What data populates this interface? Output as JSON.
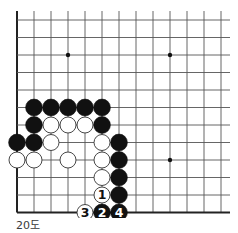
{
  "diagram": {
    "type": "go-board-fragment",
    "caption": "20도",
    "grid": {
      "columns": 13,
      "rows": 12,
      "origin_x": 17,
      "origin_y": 20,
      "spacing_x": 17,
      "spacing_y": 17.5,
      "line_top_y": 11,
      "line_right_x": 230,
      "edges": [
        "left",
        "bottom"
      ]
    },
    "colors": {
      "line": "#555555",
      "edge": "#222222",
      "black_stone": "#111111",
      "white_stone": "#ffffff",
      "white_stone_outline": "#333333",
      "star_point": "#111111"
    },
    "star_points": [
      {
        "col": 3,
        "row": 2
      },
      {
        "col": 9,
        "row": 2
      },
      {
        "col": 9,
        "row": 8
      }
    ],
    "stones": {
      "black": [
        {
          "col": 1,
          "row": 5
        },
        {
          "col": 2,
          "row": 5
        },
        {
          "col": 3,
          "row": 5
        },
        {
          "col": 4,
          "row": 5
        },
        {
          "col": 5,
          "row": 5
        },
        {
          "col": 1,
          "row": 6
        },
        {
          "col": 5,
          "row": 6
        },
        {
          "col": 0,
          "row": 7
        },
        {
          "col": 1,
          "row": 7
        },
        {
          "col": 6,
          "row": 7
        },
        {
          "col": 6,
          "row": 8
        },
        {
          "col": 6,
          "row": 9
        },
        {
          "col": 6,
          "row": 10
        }
      ],
      "white": [
        {
          "col": 2,
          "row": 6
        },
        {
          "col": 3,
          "row": 6
        },
        {
          "col": 4,
          "row": 6
        },
        {
          "col": 2,
          "row": 7
        },
        {
          "col": 5,
          "row": 7
        },
        {
          "col": 0,
          "row": 8
        },
        {
          "col": 1,
          "row": 8
        },
        {
          "col": 3,
          "row": 8
        },
        {
          "col": 5,
          "row": 8
        },
        {
          "col": 5,
          "row": 9
        }
      ]
    },
    "moves": [
      {
        "number": "1",
        "color": "white",
        "col": 5,
        "row": 10
      },
      {
        "number": "2",
        "color": "black",
        "col": 5,
        "row": 11
      },
      {
        "number": "3",
        "color": "white",
        "col": 4,
        "row": 11
      },
      {
        "number": "4",
        "color": "black",
        "col": 6,
        "row": 11
      }
    ]
  }
}
